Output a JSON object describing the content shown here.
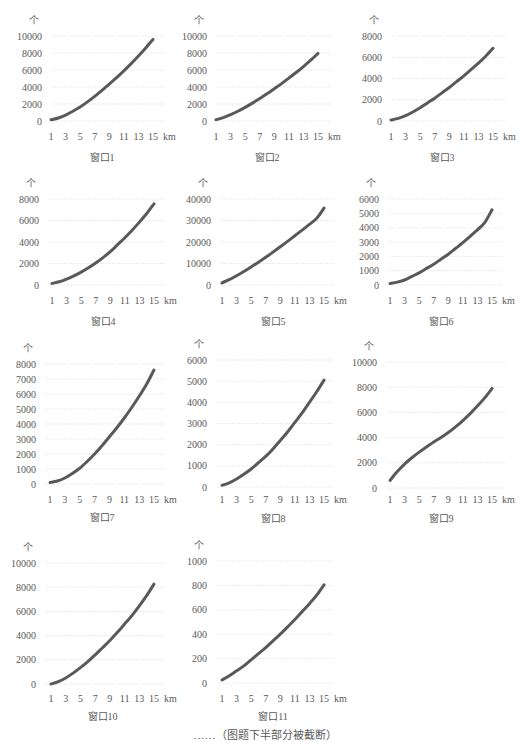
{
  "figure": {
    "caption": "……（图题下半部分被截断）"
  },
  "style": {
    "line_color": "#595959",
    "grid_color": "#e6e6e6",
    "text_color": "#595959"
  },
  "chart_data": [
    {
      "type": "line",
      "title": "窗口1",
      "ylabel": "个",
      "xlabel": "km",
      "x": [
        1,
        2,
        3,
        4,
        5,
        6,
        7,
        8,
        9,
        10,
        11,
        12,
        13,
        14,
        15
      ],
      "xticks": [
        "1",
        "3",
        "5",
        "7",
        "9",
        "11",
        "13",
        "15"
      ],
      "yticks": [
        "0",
        "2000",
        "4000",
        "6000",
        "8000",
        "10000"
      ],
      "ylim": [
        0,
        10000
      ],
      "grid": true,
      "values": [
        150,
        350,
        700,
        1150,
        1650,
        2250,
        2900,
        3600,
        4350,
        5100,
        5900,
        6750,
        7650,
        8600,
        9600
      ]
    },
    {
      "type": "line",
      "title": "窗口2",
      "ylabel": "个",
      "xlabel": "km",
      "x": [
        1,
        2,
        3,
        4,
        5,
        6,
        7,
        8,
        9,
        10,
        11,
        12,
        13,
        14,
        15
      ],
      "xticks": [
        "1",
        "3",
        "5",
        "7",
        "9",
        "11",
        "13",
        "15"
      ],
      "yticks": [
        "0",
        "2000",
        "4000",
        "6000",
        "8000",
        "10000"
      ],
      "ylim": [
        0,
        10000
      ],
      "grid": true,
      "values": [
        150,
        400,
        750,
        1150,
        1600,
        2100,
        2650,
        3200,
        3800,
        4400,
        5050,
        5700,
        6400,
        7150,
        7950
      ]
    },
    {
      "type": "line",
      "title": "窗口3",
      "ylabel": "个",
      "xlabel": "km",
      "x": [
        1,
        2,
        3,
        4,
        5,
        6,
        7,
        8,
        9,
        10,
        11,
        12,
        13,
        14,
        15
      ],
      "xticks": [
        "1",
        "3",
        "5",
        "7",
        "9",
        "11",
        "13",
        "15"
      ],
      "yticks": [
        "0",
        "2000",
        "4000",
        "6000",
        "8000"
      ],
      "ylim": [
        0,
        8000
      ],
      "grid": true,
      "values": [
        100,
        250,
        500,
        850,
        1250,
        1700,
        2150,
        2650,
        3150,
        3700,
        4250,
        4850,
        5450,
        6100,
        6850
      ]
    },
    {
      "type": "line",
      "title": "窗口4",
      "ylabel": "个",
      "xlabel": "km",
      "x": [
        1,
        2,
        3,
        4,
        5,
        6,
        7,
        8,
        9,
        10,
        11,
        12,
        13,
        14,
        15
      ],
      "xticks": [
        "1",
        "3",
        "5",
        "7",
        "9",
        "11",
        "13",
        "15"
      ],
      "yticks": [
        "0",
        "2000",
        "4000",
        "6000",
        "8000"
      ],
      "ylim": [
        0,
        8000
      ],
      "grid": true,
      "values": [
        150,
        300,
        550,
        850,
        1200,
        1600,
        2050,
        2550,
        3100,
        3750,
        4400,
        5100,
        5850,
        6650,
        7550
      ]
    },
    {
      "type": "line",
      "title": "窗口5",
      "ylabel": "个",
      "xlabel": "km",
      "x": [
        1,
        2,
        3,
        4,
        5,
        6,
        7,
        8,
        9,
        10,
        11,
        12,
        13,
        14,
        15
      ],
      "xticks": [
        "1",
        "3",
        "5",
        "7",
        "9",
        "11",
        "13",
        "15"
      ],
      "yticks": [
        "0",
        "10000",
        "20000",
        "30000",
        "40000"
      ],
      "ylim": [
        0,
        40000
      ],
      "grid": true,
      "values": [
        1000,
        2500,
        4300,
        6300,
        8400,
        10600,
        12900,
        15300,
        17800,
        20300,
        22900,
        25500,
        28200,
        31000,
        35800
      ]
    },
    {
      "type": "line",
      "title": "窗口6",
      "ylabel": "个",
      "xlabel": "km",
      "x": [
        1,
        2,
        3,
        4,
        5,
        6,
        7,
        8,
        9,
        10,
        11,
        12,
        13,
        14,
        15
      ],
      "xticks": [
        "1",
        "3",
        "5",
        "7",
        "9",
        "11",
        "13",
        "15"
      ],
      "yticks": [
        "0",
        "1000",
        "2000",
        "3000",
        "4000",
        "5000",
        "6000"
      ],
      "ylim": [
        0,
        6000
      ],
      "grid": true,
      "values": [
        100,
        200,
        350,
        600,
        850,
        1150,
        1450,
        1800,
        2150,
        2550,
        2950,
        3400,
        3850,
        4350,
        5250
      ]
    },
    {
      "type": "line",
      "title": "窗口7",
      "ylabel": "个",
      "xlabel": "km",
      "x": [
        1,
        2,
        3,
        4,
        5,
        6,
        7,
        8,
        9,
        10,
        11,
        12,
        13,
        14,
        15
      ],
      "xticks": [
        "1",
        "3",
        "5",
        "7",
        "9",
        "11",
        "13",
        "15"
      ],
      "yticks": [
        "0",
        "1000",
        "2000",
        "3000",
        "4000",
        "5000",
        "6000",
        "7000",
        "8000"
      ],
      "ylim": [
        0,
        8000
      ],
      "grid": true,
      "values": [
        100,
        200,
        400,
        700,
        1050,
        1500,
        2000,
        2550,
        3150,
        3750,
        4400,
        5100,
        5850,
        6650,
        7600
      ]
    },
    {
      "type": "line",
      "title": "窗口8",
      "ylabel": "个",
      "xlabel": "km",
      "x": [
        1,
        2,
        3,
        4,
        5,
        6,
        7,
        8,
        9,
        10,
        11,
        12,
        13,
        14,
        15
      ],
      "xticks": [
        "1",
        "3",
        "5",
        "7",
        "9",
        "11",
        "13",
        "15"
      ],
      "yticks": [
        "0",
        "1000",
        "2000",
        "3000",
        "4000",
        "5000",
        "6000"
      ],
      "ylim": [
        0,
        6000
      ],
      "grid": true,
      "values": [
        80,
        200,
        380,
        600,
        850,
        1150,
        1450,
        1800,
        2200,
        2600,
        3050,
        3500,
        4000,
        4500,
        5050
      ]
    },
    {
      "type": "line",
      "title": "窗口9",
      "ylabel": "个",
      "xlabel": "km",
      "x": [
        1,
        2,
        3,
        4,
        5,
        6,
        7,
        8,
        9,
        10,
        11,
        12,
        13,
        14,
        15
      ],
      "xticks": [
        "1",
        "3",
        "5",
        "7",
        "9",
        "11",
        "13",
        "15"
      ],
      "yticks": [
        "0",
        "2000",
        "4000",
        "6000",
        "8000",
        "10000"
      ],
      "ylim": [
        0,
        10000
      ],
      "grid": true,
      "values": [
        600,
        1300,
        1900,
        2400,
        2850,
        3250,
        3650,
        4000,
        4400,
        4850,
        5350,
        5900,
        6500,
        7150,
        7900
      ]
    },
    {
      "type": "line",
      "title": "窗口10",
      "ylabel": "个",
      "xlabel": "km",
      "x": [
        1,
        2,
        3,
        4,
        5,
        6,
        7,
        8,
        9,
        10,
        11,
        12,
        13,
        14,
        15
      ],
      "xticks": [
        "1",
        "3",
        "5",
        "7",
        "9",
        "11",
        "13",
        "15"
      ],
      "yticks": [
        "0",
        "2000",
        "4000",
        "6000",
        "8000",
        "10000"
      ],
      "ylim": [
        0,
        10000
      ],
      "grid": true,
      "values": [
        0,
        200,
        500,
        900,
        1350,
        1850,
        2400,
        3000,
        3600,
        4250,
        4950,
        5650,
        6450,
        7300,
        8250
      ]
    },
    {
      "type": "line",
      "title": "窗口11",
      "ylabel": "个",
      "xlabel": "km",
      "x": [
        1,
        2,
        3,
        4,
        5,
        6,
        7,
        8,
        9,
        10,
        11,
        12,
        13,
        14,
        15
      ],
      "xticks": [
        "1",
        "3",
        "5",
        "7",
        "9",
        "11",
        "13",
        "15"
      ],
      "yticks": [
        "0",
        "200",
        "400",
        "600",
        "800",
        "1000"
      ],
      "ylim": [
        0,
        1000
      ],
      "grid": true,
      "values": [
        25,
        60,
        100,
        140,
        190,
        240,
        290,
        345,
        400,
        460,
        520,
        585,
        650,
        720,
        805
      ]
    }
  ]
}
